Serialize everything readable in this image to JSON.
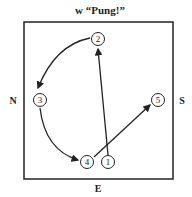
{
  "title": "w “Pung!”",
  "directions": {
    "north": "N",
    "south": "S",
    "east": "E"
  },
  "positions": [
    {
      "id": "1",
      "label": "1",
      "x": 108,
      "y": 162
    },
    {
      "id": "2",
      "label": "2",
      "x": 98,
      "y": 39
    },
    {
      "id": "3",
      "label": "3",
      "x": 40,
      "y": 100
    },
    {
      "id": "4",
      "label": "4",
      "x": 87,
      "y": 162
    },
    {
      "id": "5",
      "label": "5",
      "x": 158,
      "y": 100
    }
  ],
  "arrows": [
    {
      "from": "1",
      "to": "2",
      "type": "straight"
    },
    {
      "from": "2",
      "to": "3",
      "type": "curved"
    },
    {
      "from": "3",
      "to": "4",
      "type": "curved"
    },
    {
      "from": "4",
      "to": "5",
      "type": "straight"
    }
  ],
  "colors": {
    "ink": "#222222",
    "background": "#ffffff"
  }
}
